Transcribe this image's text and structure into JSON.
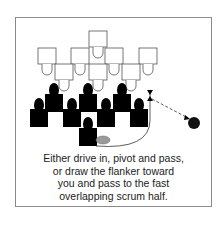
{
  "caption": {
    "lines": [
      "Either drive in, pivot and pass,",
      "or draw the flanker toward",
      "you and pass to the fast",
      "overlapping scrum half."
    ]
  },
  "diagram": {
    "defenders_label": "opposing scrum (white outlines)",
    "attackers_label": "attacking players (black)",
    "ball_color": "#9a9a9a",
    "target_player_color": "#111111"
  }
}
